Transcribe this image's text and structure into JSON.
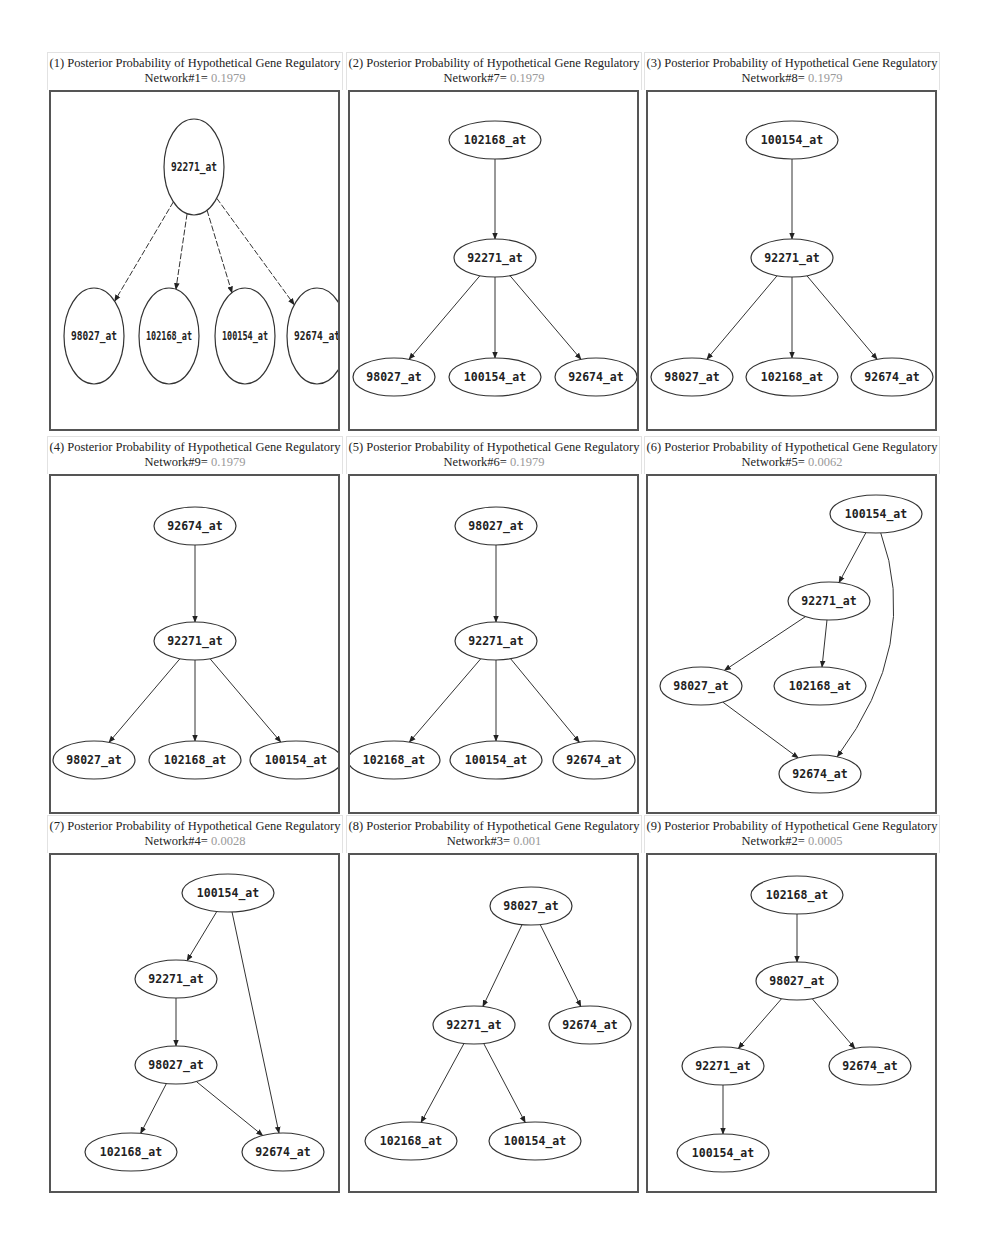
{
  "figure": {
    "title_prefix": "Posterior Probability of Hypothetical Gene Regulatory",
    "panels": [
      {
        "index": "(1)",
        "network": "Network#1=",
        "probability": "0.1979",
        "style": "circle",
        "height": 337,
        "nodes": [
          {
            "id": "92271_at",
            "x": 143,
            "y": 75
          },
          {
            "id": "98027_at",
            "x": 43,
            "y": 244
          },
          {
            "id": "102168_at",
            "x": 118,
            "y": 244
          },
          {
            "id": "100154_at",
            "x": 194,
            "y": 244
          },
          {
            "id": "92674_at",
            "x": 266,
            "y": 244
          }
        ],
        "edges": [
          [
            "92271_at",
            "98027_at"
          ],
          [
            "92271_at",
            "102168_at"
          ],
          [
            "92271_at",
            "100154_at"
          ],
          [
            "92271_at",
            "92674_at"
          ]
        ]
      },
      {
        "index": "(2)",
        "network": "Network#7=",
        "probability": "0.1979",
        "style": "ellipse",
        "height": 337,
        "nodes": [
          {
            "id": "102168_at",
            "x": 145,
            "y": 48
          },
          {
            "id": "92271_at",
            "x": 145,
            "y": 166
          },
          {
            "id": "98027_at",
            "x": 44,
            "y": 285
          },
          {
            "id": "100154_at",
            "x": 145,
            "y": 285
          },
          {
            "id": "92674_at",
            "x": 246,
            "y": 285
          }
        ],
        "edges": [
          [
            "102168_at",
            "92271_at"
          ],
          [
            "92271_at",
            "98027_at"
          ],
          [
            "92271_at",
            "100154_at"
          ],
          [
            "92271_at",
            "92674_at"
          ]
        ]
      },
      {
        "index": "(3)",
        "network": "Network#8=",
        "probability": "0.1979",
        "style": "ellipse",
        "height": 337,
        "nodes": [
          {
            "id": "100154_at",
            "x": 144,
            "y": 48
          },
          {
            "id": "92271_at",
            "x": 144,
            "y": 166
          },
          {
            "id": "98027_at",
            "x": 44,
            "y": 285
          },
          {
            "id": "102168_at",
            "x": 144,
            "y": 285
          },
          {
            "id": "92674_at",
            "x": 244,
            "y": 285
          }
        ],
        "edges": [
          [
            "100154_at",
            "92271_at"
          ],
          [
            "92271_at",
            "98027_at"
          ],
          [
            "92271_at",
            "102168_at"
          ],
          [
            "92271_at",
            "92674_at"
          ]
        ]
      },
      {
        "index": "(4)",
        "network": "Network#9=",
        "probability": "0.1979",
        "style": "ellipse",
        "height": 336,
        "nodes": [
          {
            "id": "92674_at",
            "x": 144,
            "y": 50
          },
          {
            "id": "92271_at",
            "x": 144,
            "y": 165
          },
          {
            "id": "98027_at",
            "x": 43,
            "y": 284
          },
          {
            "id": "102168_at",
            "x": 144,
            "y": 284
          },
          {
            "id": "100154_at",
            "x": 245,
            "y": 284
          }
        ],
        "edges": [
          [
            "92674_at",
            "92271_at"
          ],
          [
            "92271_at",
            "98027_at"
          ],
          [
            "92271_at",
            "102168_at"
          ],
          [
            "92271_at",
            "100154_at"
          ]
        ]
      },
      {
        "index": "(5)",
        "network": "Network#6=",
        "probability": "0.1979",
        "style": "ellipse",
        "height": 336,
        "nodes": [
          {
            "id": "98027_at",
            "x": 146,
            "y": 50
          },
          {
            "id": "92271_at",
            "x": 146,
            "y": 165
          },
          {
            "id": "102168_at",
            "x": 44,
            "y": 284
          },
          {
            "id": "100154_at",
            "x": 146,
            "y": 284
          },
          {
            "id": "92674_at",
            "x": 244,
            "y": 284
          }
        ],
        "edges": [
          [
            "98027_at",
            "92271_at"
          ],
          [
            "92271_at",
            "102168_at"
          ],
          [
            "92271_at",
            "100154_at"
          ],
          [
            "92271_at",
            "92674_at"
          ]
        ]
      },
      {
        "index": "(6)",
        "network": "Network#5=",
        "probability": "0.0062",
        "style": "ellipse",
        "height": 336,
        "nodes": [
          {
            "id": "100154_at",
            "x": 228,
            "y": 38
          },
          {
            "id": "92271_at",
            "x": 181,
            "y": 125
          },
          {
            "id": "98027_at",
            "x": 53,
            "y": 210
          },
          {
            "id": "102168_at",
            "x": 172,
            "y": 210
          },
          {
            "id": "92674_at",
            "x": 172,
            "y": 298
          }
        ],
        "edges": [
          [
            "100154_at",
            "92271_at"
          ],
          [
            "100154_at",
            "92674_at",
            "curve"
          ],
          [
            "92271_at",
            "98027_at"
          ],
          [
            "92271_at",
            "102168_at"
          ],
          [
            "98027_at",
            "92674_at"
          ]
        ]
      },
      {
        "index": "(7)",
        "network": "Network#4=",
        "probability": "0.0028",
        "style": "ellipse",
        "height": 336,
        "nodes": [
          {
            "id": "100154_at",
            "x": 177,
            "y": 38
          },
          {
            "id": "92271_at",
            "x": 125,
            "y": 124
          },
          {
            "id": "98027_at",
            "x": 125,
            "y": 210
          },
          {
            "id": "102168_at",
            "x": 80,
            "y": 297
          },
          {
            "id": "92674_at",
            "x": 232,
            "y": 297
          }
        ],
        "edges": [
          [
            "100154_at",
            "92271_at"
          ],
          [
            "100154_at",
            "92674_at"
          ],
          [
            "92271_at",
            "98027_at"
          ],
          [
            "98027_at",
            "102168_at"
          ],
          [
            "98027_at",
            "92674_at"
          ]
        ]
      },
      {
        "index": "(8)",
        "network": "Network#3=",
        "probability": "0.001",
        "style": "ellipse",
        "height": 336,
        "nodes": [
          {
            "id": "98027_at",
            "x": 181,
            "y": 51
          },
          {
            "id": "92271_at",
            "x": 124,
            "y": 170
          },
          {
            "id": "92674_at",
            "x": 240,
            "y": 170
          },
          {
            "id": "102168_at",
            "x": 61,
            "y": 286
          },
          {
            "id": "100154_at",
            "x": 185,
            "y": 286
          }
        ],
        "edges": [
          [
            "98027_at",
            "92271_at"
          ],
          [
            "98027_at",
            "92674_at"
          ],
          [
            "92271_at",
            "102168_at"
          ],
          [
            "92271_at",
            "100154_at"
          ]
        ]
      },
      {
        "index": "(9)",
        "network": "Network#2=",
        "probability": "0.0005",
        "style": "ellipse",
        "height": 336,
        "nodes": [
          {
            "id": "102168_at",
            "x": 149,
            "y": 40
          },
          {
            "id": "98027_at",
            "x": 149,
            "y": 126
          },
          {
            "id": "92271_at",
            "x": 75,
            "y": 211
          },
          {
            "id": "92674_at",
            "x": 222,
            "y": 211
          },
          {
            "id": "100154_at",
            "x": 75,
            "y": 298
          }
        ],
        "edges": [
          [
            "102168_at",
            "98027_at"
          ],
          [
            "98027_at",
            "92271_at"
          ],
          [
            "98027_at",
            "92674_at"
          ],
          [
            "92271_at",
            "100154_at"
          ]
        ]
      }
    ]
  }
}
